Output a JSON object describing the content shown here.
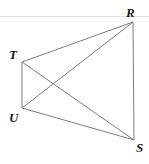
{
  "figure": {
    "kind": "geometry-diagram",
    "background_color": "#ffffff",
    "stroke_color": "#7d7d7d",
    "label_color": "#1a1a1a",
    "rule_color": "#e3e3e3",
    "width": 149,
    "height": 164,
    "top_rule": {
      "name": "top-divider-line",
      "x1": 0,
      "y1": 16.5,
      "x2": 149,
      "y2": 16.5
    },
    "vertices": [
      {
        "id": "T",
        "label": "T",
        "x": 22,
        "y": 62,
        "label_x": 9,
        "label_y": 48
      },
      {
        "id": "R",
        "label": "R",
        "x": 133,
        "y": 22,
        "label_x": 126,
        "label_y": 6
      },
      {
        "id": "U",
        "label": "U",
        "x": 22,
        "y": 108,
        "label_x": 9,
        "label_y": 111
      },
      {
        "id": "S",
        "label": "S",
        "x": 134,
        "y": 140,
        "label_x": 136,
        "label_y": 141
      }
    ],
    "edges": [
      {
        "id": "TR",
        "name": "side-t-r",
        "from": "T",
        "to": "R",
        "x1": 22,
        "y1": 62,
        "x2": 133,
        "y2": 22
      },
      {
        "id": "RS",
        "name": "side-r-s",
        "from": "R",
        "to": "S",
        "x1": 133,
        "y1": 22,
        "x2": 134,
        "y2": 140
      },
      {
        "id": "SU",
        "name": "side-s-u",
        "from": "S",
        "to": "U",
        "x1": 134,
        "y1": 140,
        "x2": 22,
        "y2": 108
      },
      {
        "id": "UT",
        "name": "side-u-t",
        "from": "U",
        "to": "T",
        "x1": 22,
        "y1": 108,
        "x2": 22,
        "y2": 62
      }
    ],
    "diagonals": [
      {
        "id": "TS",
        "name": "diagonal-t-s",
        "from": "T",
        "to": "S",
        "x1": 22,
        "y1": 62,
        "x2": 134,
        "y2": 140
      },
      {
        "id": "UR",
        "name": "diagonal-u-r",
        "from": "U",
        "to": "R",
        "x1": 22,
        "y1": 108,
        "x2": 133,
        "y2": 22
      }
    ]
  }
}
